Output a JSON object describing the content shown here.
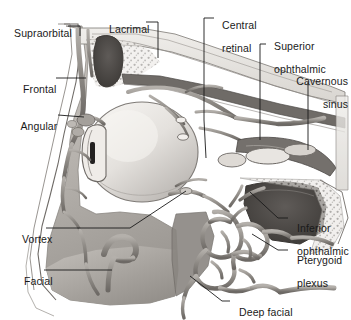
{
  "figure": {
    "kind": "anatomical-illustration",
    "style": "grayscale halftone medical illustration",
    "background_color": "#ffffff",
    "label_color": "#1a1a1a",
    "leader_color": "#1a1a1a"
  },
  "labels": [
    {
      "id": "supraorbital",
      "text": "Supraorbital",
      "text2": "",
      "x": 8,
      "y": 21,
      "align": "left"
    },
    {
      "id": "lacrimal",
      "text": "Lacrimal",
      "text2": "",
      "x": 103,
      "y": 16,
      "align": "left"
    },
    {
      "id": "central-retinal",
      "text": "Central",
      "text2": "retinal",
      "x": 216,
      "y": 11,
      "align": "left"
    },
    {
      "id": "superior-ophthalmic",
      "text": "Superior",
      "text2": "ophthalmic",
      "x": 268,
      "y": 32,
      "align": "left"
    },
    {
      "id": "cavernous-sinus",
      "text": "Cavernous",
      "text2": "sinus",
      "x": 281,
      "y": 67,
      "align": "right"
    },
    {
      "id": "frontal",
      "text": "Frontal",
      "text2": "",
      "x": 17,
      "y": 72,
      "align": "left"
    },
    {
      "id": "angular",
      "text": "Angular",
      "text2": "",
      "x": 15,
      "y": 109,
      "align": "left"
    },
    {
      "id": "vortex",
      "text": "Vortex",
      "text2": "",
      "x": 16,
      "y": 222,
      "align": "left"
    },
    {
      "id": "facial",
      "text": "Facial",
      "text2": "",
      "x": 18,
      "y": 264,
      "align": "left"
    },
    {
      "id": "inferior-ophthalmic",
      "text": "Inferior",
      "text2": "ophthalmic",
      "x": 290,
      "y": 211,
      "align": "left"
    },
    {
      "id": "pterygoid-plexus",
      "text": "Pterygoid",
      "text2": "plexus",
      "x": 290,
      "y": 243,
      "align": "left"
    },
    {
      "id": "deep-facial",
      "text": "Deep facial",
      "text2": "",
      "x": 232,
      "y": 295,
      "align": "left"
    }
  ],
  "structures": [
    {
      "id": "frontal-sinus",
      "name": "frontal sinus cavity"
    },
    {
      "id": "globe",
      "name": "eyeball / globe"
    },
    {
      "id": "cornea-lens",
      "name": "cornea and lens"
    },
    {
      "id": "maxillary-sinus",
      "name": "maxillary sinus cavity"
    },
    {
      "id": "sphenoid-sinus",
      "name": "sphenoid sinus cavity"
    },
    {
      "id": "pterygoid-network",
      "name": "pterygoid venous plexus"
    },
    {
      "id": "facial-soft-tissue",
      "name": "facial soft tissue mass"
    },
    {
      "id": "orbital-veins",
      "name": "orbital venous network"
    },
    {
      "id": "bone-stipple",
      "name": "cancellous bone stippling"
    }
  ]
}
